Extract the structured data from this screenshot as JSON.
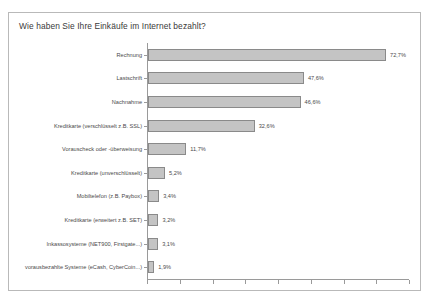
{
  "chart_data": {
    "type": "bar",
    "orientation": "horizontal",
    "title": "Wie haben Sie Ihre Einkäufe im Internet bezahlt?",
    "xlabel": "",
    "ylabel": "",
    "xlim": [
      0,
      80
    ],
    "grid": false,
    "legend": null,
    "value_suffix": "%",
    "decimal_separator": ",",
    "categories": [
      "Rechnung",
      "Lastschrift",
      "Nachnahme",
      "Kreditkarte (verschlüsselt z.B. SSL)",
      "Vorauscheck oder -überweisung",
      "Kreditkarte (unverschlüsselt)",
      "Mobiltelefon (z.B. Paybox)",
      "Kreditkarte (erweitert z.B. SET)",
      "Inkassosysteme (NET900, Firstgate...)",
      "vorausbezahlte Systeme (eCash, CyberCoin...)"
    ],
    "values": [
      72.7,
      47.6,
      46.6,
      32.6,
      11.7,
      5.2,
      3.4,
      3.2,
      3.1,
      1.9
    ],
    "value_labels": [
      "72,7%",
      "47,6%",
      "46,6%",
      "32,6%",
      "11,7%",
      "5,2%",
      "3,4%",
      "3,2%",
      "3,1%",
      "1,9%"
    ],
    "x_ticks": [
      0,
      10,
      20,
      30,
      40,
      50,
      60,
      70,
      80
    ],
    "x_tick_labels": [
      "",
      "",
      "",
      "",
      "",
      "",
      "",
      "",
      ""
    ],
    "bar_fill_color": "#c4c4c4",
    "bar_border_color": "#8a8a8a",
    "axis_color": "#9a9a9a",
    "text_color": "#4a4a4a",
    "frame_border_color": "#b9b9b9",
    "background_color": "#ffffff"
  },
  "caption": ""
}
